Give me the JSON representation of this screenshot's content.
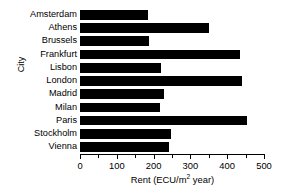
{
  "chart_data": {
    "type": "bar",
    "orientation": "horizontal",
    "title": "",
    "xlabel": "Rent (ECU/m² year)",
    "ylabel": "City",
    "categories": [
      "Amsterdam",
      "Athens",
      "Brussels",
      "Frankfurt",
      "Lisbon",
      "London",
      "Madrid",
      "Milan",
      "Paris",
      "Stockholm",
      "Vienna"
    ],
    "values": [
      185,
      350,
      188,
      435,
      220,
      440,
      227,
      218,
      455,
      247,
      243
    ],
    "xlim": [
      0,
      500
    ],
    "xticks": [
      0,
      100,
      200,
      300,
      400,
      500
    ],
    "xtick_labels": [
      "0",
      "100",
      "200",
      "300",
      "400",
      "500"
    ],
    "minor_ticks": [
      50,
      150,
      250,
      350,
      450
    ],
    "grid": false,
    "legend": false,
    "bar_color": "#000000",
    "background_color": "#ffffff"
  },
  "axis": {
    "x_title_main": "Rent (ECU/m",
    "x_title_sup": "2",
    "x_title_tail": " year)",
    "y_title": "City"
  }
}
